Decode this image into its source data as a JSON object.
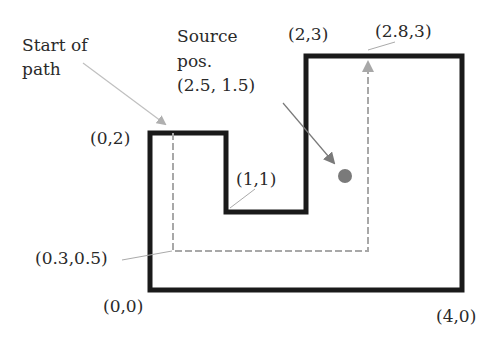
{
  "diagram": {
    "outline_color": "#1a1a1a",
    "path_color": "#a8a8a8",
    "source_color": "#7a7a7a",
    "outer_polygon": [
      [
        0,
        0
      ],
      [
        4,
        0
      ],
      [
        4,
        3
      ],
      [
        2,
        3
      ],
      [
        2,
        1
      ],
      [
        1,
        1
      ],
      [
        1,
        2
      ],
      [
        0,
        2
      ]
    ],
    "path": [
      [
        0.3,
        2
      ],
      [
        0.3,
        0.5
      ],
      [
        2.8,
        0.5
      ],
      [
        2.8,
        3
      ]
    ],
    "source_position": [
      2.5,
      1.5
    ],
    "labels": {
      "start_of_path_line1": "Start of",
      "start_of_path_line2": "path",
      "source_line1": "Source",
      "source_line2": "pos.",
      "source_line3": "(2.5, 1.5)",
      "p_0_2": "(0,2)",
      "p_2_3": "(2,3)",
      "p_2_8_3": "(2.8,3)",
      "p_1_1": "(1,1)",
      "p_0_3_0_5": "(0.3,0.5)",
      "p_0_0": "(0,0)",
      "p_4_0": "(4,0)"
    }
  }
}
